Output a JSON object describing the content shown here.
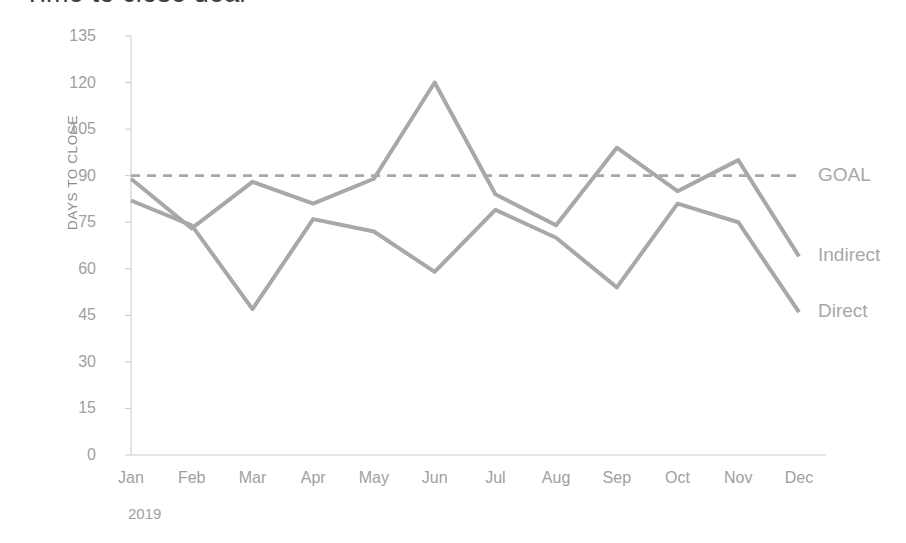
{
  "chart_data": {
    "type": "line",
    "title": "Time to close deal",
    "xlabel": "",
    "ylabel": "DAYS TO CLOSE",
    "period_label": "2019",
    "categories": [
      "Jan",
      "Feb",
      "Mar",
      "Apr",
      "May",
      "Jun",
      "Jul",
      "Aug",
      "Sep",
      "Oct",
      "Nov",
      "Dec"
    ],
    "ylim": [
      0,
      135
    ],
    "yticks": [
      0,
      15,
      30,
      45,
      60,
      75,
      90,
      105,
      120,
      135
    ],
    "grid": false,
    "legend_position": "right-of-plot-end-labels",
    "series": [
      {
        "name": "GOAL",
        "style": "dashed",
        "color": "#a8a8a8",
        "constant": 90,
        "values": [
          90,
          90,
          90,
          90,
          90,
          90,
          90,
          90,
          90,
          90,
          90,
          90
        ]
      },
      {
        "name": "Indirect",
        "style": "solid",
        "color": "#a8a8a8",
        "values": [
          89,
          73,
          88,
          81,
          89,
          120,
          84,
          74,
          99,
          85,
          95,
          64
        ]
      },
      {
        "name": "Direct",
        "style": "solid",
        "color": "#a8a8a8",
        "values": [
          82,
          74,
          47,
          76,
          72,
          59,
          79,
          70,
          54,
          81,
          75,
          46
        ]
      }
    ]
  },
  "axis": {
    "y_title": "DAYS TO CLOSE"
  },
  "colors": {
    "line": "#a8a8a8",
    "axis": "#c9c9c9",
    "tick_text": "#a0a0a0",
    "title_text": "#3d3d3d"
  }
}
